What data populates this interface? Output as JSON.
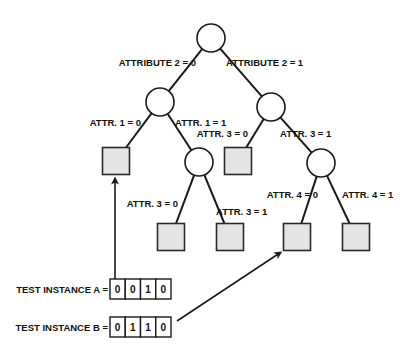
{
  "diagram": {
    "type": "decision-tree",
    "nodes": [
      {
        "id": "root",
        "kind": "split",
        "attribute": "ATTRIBUTE 2"
      },
      {
        "id": "n1",
        "kind": "split",
        "attribute": "ATTR. 1"
      },
      {
        "id": "n2",
        "kind": "split",
        "attribute": "ATTR. 3"
      },
      {
        "id": "n3",
        "kind": "split",
        "attribute": "ATTR. 3"
      },
      {
        "id": "n4",
        "kind": "split",
        "attribute": "ATTR. 4"
      },
      {
        "id": "leaf1",
        "kind": "leaf"
      },
      {
        "id": "leaf2",
        "kind": "leaf"
      },
      {
        "id": "leaf3",
        "kind": "leaf"
      },
      {
        "id": "leaf4",
        "kind": "leaf"
      },
      {
        "id": "leaf5",
        "kind": "leaf"
      },
      {
        "id": "leaf6",
        "kind": "leaf"
      }
    ],
    "edges": [
      {
        "from": "root",
        "to": "n1",
        "label": "ATTRIBUTE 2 = 0"
      },
      {
        "from": "root",
        "to": "n2",
        "label": "ATTRIBUTE 2 = 1"
      },
      {
        "from": "n1",
        "to": "leaf1",
        "label": "ATTR. 1 = 0"
      },
      {
        "from": "n1",
        "to": "n3",
        "label": "ATTR. 1 = 1"
      },
      {
        "from": "n2",
        "to": "leaf2",
        "label": "ATTR. 3 = 0"
      },
      {
        "from": "n2",
        "to": "n4",
        "label": "ATTR. 3 = 1"
      },
      {
        "from": "n3",
        "to": "leaf3",
        "label": "ATTR. 3 = 0"
      },
      {
        "from": "n3",
        "to": "leaf4",
        "label": "ATTR. 3 = 1"
      },
      {
        "from": "n4",
        "to": "leaf5",
        "label": "ATTR. 4 = 0"
      },
      {
        "from": "n4",
        "to": "leaf6",
        "label": "ATTR. 4 = 1"
      }
    ],
    "test_instances": [
      {
        "label": "TEST INSTANCE A =",
        "values": [
          "0",
          "0",
          "1",
          "0"
        ],
        "arrives_at": "leaf1"
      },
      {
        "label": "TEST INSTANCE B =",
        "values": [
          "0",
          "1",
          "1",
          "0"
        ],
        "arrives_at": "leaf5"
      }
    ],
    "colors": {
      "line": "#1a1a1a",
      "leaf_fill": "#e4e4e4",
      "node_fill": "#ffffff"
    }
  }
}
